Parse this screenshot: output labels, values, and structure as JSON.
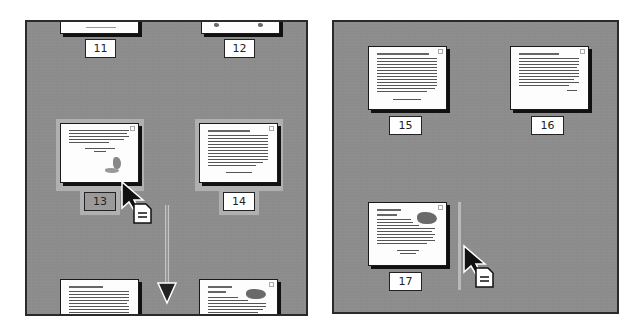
{
  "colors": {
    "panel_bg": "#8c8c8c",
    "panel_border": "#2a2a2a",
    "thumb_bg": "#fdfdfd",
    "selection_highlight": "#b0b0b0",
    "insertion_bar": "#b9b9b9"
  },
  "left_panel": {
    "pages": [
      {
        "number": "11",
        "state": "partially-visible-top"
      },
      {
        "number": "12",
        "state": "partially-visible-top"
      },
      {
        "number": "13",
        "state": "selected-dragging"
      },
      {
        "number": "14",
        "state": "selected"
      },
      {
        "number": "",
        "state": "partially-visible-bottom"
      },
      {
        "number": "",
        "state": "partially-visible-bottom"
      }
    ],
    "scroll_direction_icon": "arrow-down-icon",
    "cursor": "drag-page-cursor"
  },
  "right_panel": {
    "pages": [
      {
        "number": "15"
      },
      {
        "number": "16"
      },
      {
        "number": "17"
      }
    ],
    "insertion_indicator": "vertical-insert-bar",
    "cursor": "drag-page-cursor"
  }
}
